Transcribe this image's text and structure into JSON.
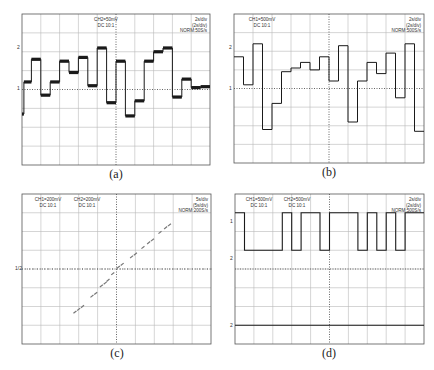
{
  "figure": {
    "grid": {
      "x_divisions": 10,
      "y_divisions": 8
    },
    "colors": {
      "trace": "#1a1a1a",
      "grid": "#b8b8b8",
      "frame": "#555555",
      "dotted": "#666666"
    }
  },
  "chart_data": [
    {
      "id": "a",
      "type": "line",
      "caption": "(a)",
      "title": "",
      "channel_labels": [
        {
          "line1": "CH2=50mV",
          "line2": "DC  10:1"
        }
      ],
      "timebase": {
        "line1": "2s/div",
        "line2": "(2s/div)",
        "line3": "NORM:50S/s"
      },
      "markers": [
        "2",
        "1"
      ],
      "xlabel": "time (div)",
      "ylabel": "voltage (div)",
      "xlim": [
        0,
        10
      ],
      "ylim": [
        -4,
        4
      ],
      "steps": {
        "x_edges": [
          0,
          0.1,
          0.5,
          1.0,
          1.5,
          2.0,
          2.5,
          3.0,
          3.5,
          4.0,
          4.5,
          5.0,
          5.5,
          6.0,
          6.5,
          7.0,
          7.5,
          8.0,
          8.5,
          9.0,
          9.5,
          10
        ],
        "values": [
          -1.3,
          0.4,
          1.6,
          -0.3,
          0.4,
          1.5,
          0.9,
          1.7,
          0.2,
          2.2,
          -0.7,
          1.5,
          -1.4,
          -0.6,
          1.5,
          2.0,
          2.2,
          -0.4,
          0.55,
          0.1,
          0.15
        ]
      }
    },
    {
      "id": "b",
      "type": "line",
      "caption": "(b)",
      "title": "",
      "channel_labels": [
        {
          "line1": "CH1=500mV",
          "line2": "DC  10:1"
        }
      ],
      "timebase": {
        "line1": "2s/div",
        "line2": "(2s/div)",
        "line3": "NORM:500S/s"
      },
      "markers": [
        "2",
        "1"
      ],
      "xlabel": "time (div)",
      "ylabel": "voltage (div)",
      "xlim": [
        0,
        10
      ],
      "ylim": [
        -4,
        4
      ],
      "steps": {
        "x_edges": [
          0,
          0.5,
          1.0,
          1.5,
          2.0,
          2.5,
          3.0,
          3.5,
          4.0,
          4.5,
          5.0,
          5.5,
          6.0,
          6.5,
          7.0,
          7.5,
          8.0,
          8.5,
          9.0,
          9.5,
          10
        ],
        "values": [
          1.7,
          0.2,
          2.4,
          -2.2,
          -0.8,
          0.9,
          1.1,
          1.4,
          1.0,
          1.7,
          0.4,
          2.3,
          -1.8,
          0.4,
          1.4,
          0.8,
          1.9,
          -0.5,
          2.4,
          -2.3
        ]
      }
    },
    {
      "id": "c",
      "type": "scatter",
      "caption": "(c)",
      "title": "",
      "channel_labels": [
        {
          "line1": "CH1=200mV",
          "line2": "DC  10:1"
        },
        {
          "line1": "CH2=200mV",
          "line2": "DC  10:1"
        }
      ],
      "timebase": {
        "line1": "5s/div",
        "line2": "(5s/div)",
        "line3": "NORM:200S/s"
      },
      "markers": [
        "1/2"
      ],
      "xlabel": "CH1 (div)",
      "ylabel": "CH2 (div)",
      "xlim": [
        -5,
        5
      ],
      "ylim": [
        -4,
        4
      ],
      "points": [
        [
          -2.2,
          -2.3
        ],
        [
          -2.0,
          -2.15
        ],
        [
          -1.8,
          -2.0
        ],
        [
          -1.3,
          -1.45
        ],
        [
          -1.1,
          -1.3
        ],
        [
          -0.8,
          -0.9
        ],
        [
          -0.6,
          -0.75
        ],
        [
          -0.45,
          -0.6
        ],
        [
          -0.2,
          -0.25
        ],
        [
          0.1,
          0.1
        ],
        [
          0.3,
          0.25
        ],
        [
          0.8,
          0.65
        ],
        [
          1.0,
          0.8
        ],
        [
          1.4,
          1.15
        ],
        [
          1.7,
          1.4
        ],
        [
          1.9,
          1.55
        ],
        [
          2.3,
          1.95
        ],
        [
          2.6,
          2.2
        ],
        [
          2.8,
          2.35
        ]
      ]
    },
    {
      "id": "d",
      "type": "line",
      "caption": "(d)",
      "title": "",
      "channel_labels": [
        {
          "line1": "CH1=500mV",
          "line2": "DC  10:1"
        },
        {
          "line1": "CH2=500mV",
          "line2": "DC  10:1"
        }
      ],
      "timebase": {
        "line1": "2s/div",
        "line2": "(2s/div)",
        "line3": "NORM:500S/s"
      },
      "markers": [
        "1",
        "2",
        "2"
      ],
      "xlabel": "time (div)",
      "ylabel": "voltage (div)",
      "xlim": [
        0,
        10
      ],
      "ylim": [
        -4,
        4
      ],
      "series": [
        {
          "name": "CH1 (digital)",
          "x_edges": [
            0,
            0.5,
            2.5,
            3.0,
            3.5,
            4.5,
            5.0,
            9.5,
            10
          ],
          "x_transitions": [
            0,
            0.5,
            2.5,
            3.0,
            3.5,
            4.5,
            5.0,
            6.5,
            7.0,
            7.5,
            8.0,
            8.5,
            9.0,
            10
          ],
          "values": [
            1,
            0,
            1,
            0,
            1,
            0,
            1,
            0,
            1,
            0,
            1,
            0,
            1
          ],
          "high": 3.0,
          "low": 1.0
        },
        {
          "name": "CH2 (reference)",
          "constant": -3.0
        }
      ]
    }
  ]
}
